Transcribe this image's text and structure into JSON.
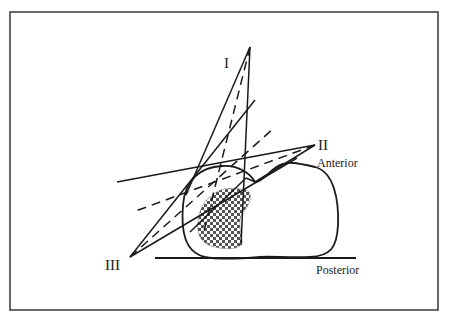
{
  "diagram": {
    "type": "radiotherapy beam arrangement (cross-section)",
    "colors": {
      "line": "#1a1a1a",
      "border": "#444444",
      "checker_dark": "#555555",
      "checker_light": "#ffffff",
      "background": "#ffffff"
    },
    "beams": [
      {
        "id": "I",
        "label": "I"
      },
      {
        "id": "II",
        "label": "II"
      },
      {
        "id": "III",
        "label": "III"
      }
    ],
    "labels": {
      "anterior": "Anterior",
      "posterior": "Posterior"
    },
    "regions": [
      {
        "name": "body-contour",
        "description": "patient outline"
      },
      {
        "name": "target-volume",
        "description": "checkered tumor region"
      }
    ]
  }
}
